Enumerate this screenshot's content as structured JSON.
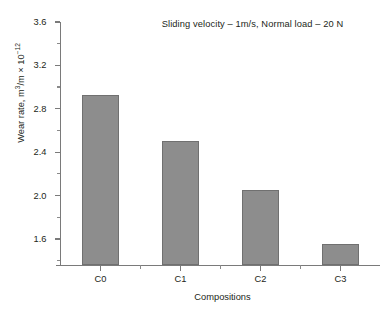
{
  "chart_data": {
    "type": "bar",
    "title": "Sliding velocity – 1m/s, Normal load – 20 N",
    "xlabel": "Compositions",
    "ylabel_text": "Wear rate, m",
    "ylabel_sup1": "3",
    "ylabel_mid": "/m × 10",
    "ylabel_sup2": "−12",
    "ylabel_plain": "Wear rate, m3/m × 10−12",
    "categories": [
      "C0",
      "C1",
      "C2",
      "C3"
    ],
    "values": [
      2.93,
      2.5,
      2.05,
      1.55
    ],
    "ylim": [
      1.36,
      3.6
    ],
    "ytick_labels": [
      "3.6",
      "3.2",
      "2.8",
      "2.4",
      "2.0",
      "1.6"
    ],
    "ytick_values": [
      3.6,
      3.2,
      2.8,
      2.4,
      2.0,
      1.6
    ],
    "yminor_values": [
      3.4,
      3.0,
      2.6,
      2.2,
      1.8,
      1.4
    ],
    "ytick_step": 0.4,
    "grid": false,
    "legend": "none",
    "bar_color": "#8d8d8d",
    "bar_edge_color": "#707070",
    "axis_color": "#7a7a7a",
    "text_color": "#231f20",
    "background": "#ffffff"
  }
}
